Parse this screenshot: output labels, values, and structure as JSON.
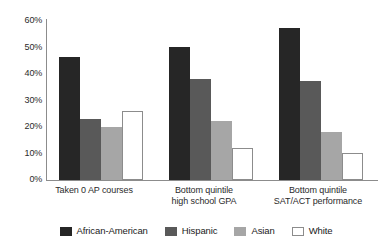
{
  "chart_data": {
    "type": "bar",
    "title": "",
    "subtitle": "",
    "xlabel": "",
    "ylabel": "",
    "ylim": [
      0,
      60
    ],
    "grid": false,
    "legend_position": "bottom",
    "y_ticks": [
      "0%",
      "10%",
      "20%",
      "30%",
      "40%",
      "50%",
      "60%"
    ],
    "y_tick_values": [
      0,
      10,
      20,
      30,
      40,
      50,
      60
    ],
    "categories": [
      "Taken 0 AP courses",
      "Bottom quintile\nhigh school GPA",
      "Bottom quintile\nSAT/ACT performance"
    ],
    "series": [
      {
        "name": "African-American",
        "color": "#262626",
        "values": [
          46,
          50,
          57
        ]
      },
      {
        "name": "Hispanic",
        "color": "#595959",
        "values": [
          23,
          38,
          37
        ]
      },
      {
        "name": "Asian",
        "color": "#a6a6a6",
        "values": [
          20,
          22,
          18
        ]
      },
      {
        "name": "White",
        "color": "#ffffff",
        "values": [
          26,
          12,
          10
        ]
      }
    ]
  }
}
